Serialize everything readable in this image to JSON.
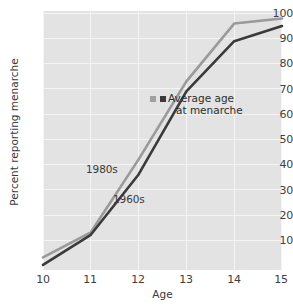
{
  "chart_data": {
    "type": "line",
    "title": "",
    "xlabel": "Age",
    "ylabel": "Percent reporting menarche",
    "xlim": [
      10,
      15
    ],
    "ylim": [
      0,
      103
    ],
    "grid": true,
    "legend_position": "inline-labels",
    "xticks": [
      "10",
      "11",
      "12",
      "13",
      "14",
      "15"
    ],
    "yticks": [
      "10",
      "20",
      "30",
      "40",
      "50",
      "60",
      "70",
      "80",
      "90",
      "100"
    ],
    "x": [
      10,
      11,
      12,
      13,
      14,
      15
    ],
    "series": [
      {
        "name": "1980s",
        "color": "#9a9a9a",
        "values": [
          5,
          15,
          44,
          75,
          98,
          100
        ]
      },
      {
        "name": "1960s",
        "color": "#3a3a3a",
        "values": [
          2,
          14,
          38,
          71,
          91,
          97
        ]
      }
    ],
    "annotations": [
      {
        "name": "average-age-at-menarche",
        "line1": "Average age",
        "line2": "at menarche",
        "markers": [
          {
            "series": "1980s",
            "x": 12.55,
            "y": 66,
            "color": "#a0a0a0"
          },
          {
            "series": "1960s",
            "x": 12.75,
            "y": 66,
            "color": "#3a3a3a"
          }
        ]
      }
    ]
  },
  "chart": {
    "xlabel": "Age",
    "ylabel": "Percent reporting menarche",
    "label_1980s": "1980s",
    "label_1960s": "1960s",
    "annotation_line1": "Average age",
    "annotation_line2": "at menarche",
    "yticks": {
      "t10": "10",
      "t20": "20",
      "t30": "30",
      "t40": "40",
      "t50": "50",
      "t60": "60",
      "t70": "70",
      "t80": "80",
      "t90": "90",
      "t100": "100"
    },
    "xticks": {
      "t10": "10",
      "t11": "11",
      "t12": "12",
      "t13": "13",
      "t14": "14",
      "t15": "15"
    }
  }
}
